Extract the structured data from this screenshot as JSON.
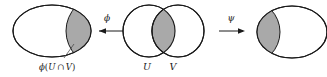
{
  "figure": {
    "kind": "set-mapping-diagram",
    "background_color": "#ffffff",
    "stroke_color": "#1a1a1a",
    "shade_color": "#a9a9a9"
  },
  "left_shape": {
    "name": "left-ellipse",
    "shaded_region_side": "right",
    "caption": "ϕ(U ∩ V)",
    "caption_parts": {
      "map": "ϕ",
      "open_paren": "(",
      "set_u": "U",
      "intersection": "∩",
      "set_v": "V",
      "close_paren": ")"
    }
  },
  "center_shape": {
    "name": "overlapping-circles",
    "shaded_region": "intersection",
    "left_circle_label": "U",
    "right_circle_label": "V"
  },
  "right_shape": {
    "name": "right-ellipse",
    "shaded_region_side": "left"
  },
  "arrows": [
    {
      "name": "phi-arrow",
      "label": "ϕ",
      "direction": "left",
      "from": "center_shape",
      "to": "left_shape"
    },
    {
      "name": "psi-arrow",
      "label": "ψ",
      "direction": "right",
      "from": "center_shape",
      "to": "right_shape"
    }
  ]
}
